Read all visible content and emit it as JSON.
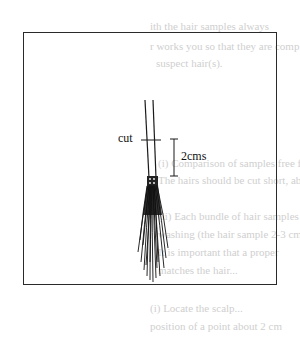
{
  "figure": {
    "cut_label": "cut",
    "scale_label": "2cms"
  },
  "bleed_through_text": [
    "ith the hair samples always",
    "r works you so that they are comp",
    "suspect hair(s).",
    "(i) Comparison of samples free from",
    "The hairs should be cut short, about",
    "(ii) Each bundle of hair samples",
    "washing (the hair sample 2-3 cm",
    "It is important that a proper",
    "matches the hair...",
    "(i) Locate the scalp...",
    "position of a point about 2 cm"
  ]
}
